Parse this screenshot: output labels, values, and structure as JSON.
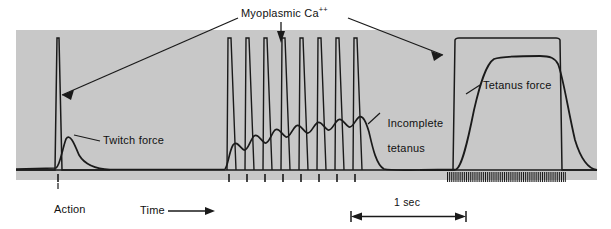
{
  "figure": {
    "title": "Myoplasmic Ca++",
    "title_base": "Myoplasmic Ca",
    "title_sup": "++",
    "panel_bg": "#c8c8c8",
    "trace_color": "#1a1a1a",
    "page_bg": "#ffffff"
  },
  "labels": {
    "twitch_force": "Twitch force",
    "action_potential_line1": "Action",
    "action_potential_line2": "potential",
    "incomplete_tetanus_line1": "Incomplete",
    "incomplete_tetanus_line2": "tetanus",
    "tetanus_force": "Tetanus force",
    "time": "Time",
    "scale_bar": "1 sec"
  },
  "chart_data": {
    "type": "line",
    "title": "Myoplasmic Ca++",
    "xlabel": "Time",
    "ylabel": "",
    "grid": false,
    "legend_position": "inline-annotations",
    "scale_bar_seconds": 1,
    "axis_ranges": {
      "x": [
        0,
        611
      ],
      "y_baseline_px": 170,
      "y_top_px": 30
    },
    "annotations": [
      {
        "text": "Myoplasmic Ca++",
        "points_to": [
          "twitch-ca-spike",
          "incomplete-tetanus-ca-spikes",
          "tetanus-ca-plateau"
        ]
      },
      {
        "text": "Twitch force",
        "points_to": "twitch-force-curve"
      },
      {
        "text": "Action potential",
        "points_to": "single-stimulus-mark"
      },
      {
        "text": "Incomplete tetanus",
        "points_to": "incomplete-tetanus-force-curve"
      },
      {
        "text": "Tetanus force",
        "points_to": "tetanus-force-curve"
      },
      {
        "text": "Time",
        "points_to": "time-axis-arrow"
      },
      {
        "text": "1 sec",
        "points_to": "scale-bar"
      }
    ],
    "series": [
      {
        "name": "Myoplasmic Ca++ (twitch)",
        "description": "single narrow tall calcium transient",
        "peak_x": 58,
        "peak_y_px": 38,
        "width_px": 4
      },
      {
        "name": "Twitch force",
        "description": "single low broad force transient following the Ca spike",
        "peak_x": 66,
        "peak_y_px": 138,
        "decay_end_x": 110
      },
      {
        "name": "Myoplasmic Ca++ (incomplete tetanus)",
        "description": "train of 8 sawtooth calcium transients",
        "spike_count": 8,
        "spike_x": [
          229,
          247,
          265,
          283,
          301,
          319,
          337,
          355
        ],
        "peak_y_px": 38
      },
      {
        "name": "Incomplete tetanus force",
        "description": "summating force with ripples rising to a partial plateau",
        "ripple_count": 8,
        "start_x": 225,
        "end_x": 375,
        "first_peak_y_px": 140,
        "last_peak_y_px": 120
      },
      {
        "name": "Myoplasmic Ca++ (complete tetanus)",
        "description": "sustained elevated calcium plateau",
        "start_x": 455,
        "end_x": 560,
        "plateau_y_px": 38
      },
      {
        "name": "Tetanus force",
        "description": "smooth fused force rising to full plateau then relaxing",
        "start_x": 458,
        "plateau_start_x": 492,
        "plateau_y_px": 58,
        "plateau_end_x": 557,
        "end_x": 597
      },
      {
        "name": "Stimulus marks (single)",
        "type": "ticks",
        "count": 1,
        "x": [
          58
        ]
      },
      {
        "name": "Stimulus marks (incomplete tetanus)",
        "type": "ticks",
        "count": 8,
        "x": [
          229,
          247,
          265,
          283,
          301,
          319,
          337,
          355
        ]
      },
      {
        "name": "Stimulus marks (complete tetanus)",
        "type": "ticks",
        "count": 64,
        "start_x": 447,
        "end_x": 565,
        "spacing_px": 1.9
      }
    ]
  }
}
